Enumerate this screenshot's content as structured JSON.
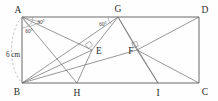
{
  "figure": {
    "shape": "rectangle",
    "vertices": [
      {
        "id": "A",
        "label": "A",
        "x": 22,
        "y": 17
      },
      {
        "id": "D",
        "label": "D",
        "x": 199,
        "y": 17
      },
      {
        "id": "B",
        "label": "B",
        "x": 22,
        "y": 83
      },
      {
        "id": "C",
        "label": "C",
        "x": 199,
        "y": 83
      },
      {
        "id": "G",
        "label": "G",
        "x": 118,
        "y": 17
      },
      {
        "id": "E",
        "label": "E",
        "x": 92,
        "y": 50
      },
      {
        "id": "F",
        "label": "F",
        "x": 137,
        "y": 50
      },
      {
        "id": "H",
        "label": "H",
        "x": 77,
        "y": 83
      },
      {
        "id": "I",
        "label": "I",
        "x": 158,
        "y": 83
      }
    ],
    "angles": [
      {
        "id": "angle-A-upper",
        "label": "30°",
        "at": "A",
        "x": 41,
        "y": 24
      },
      {
        "id": "angle-A-lower",
        "label": "60°",
        "at": "A",
        "x": 28,
        "y": 32
      },
      {
        "id": "angle-G-left",
        "label": "60°",
        "at": "G",
        "x": 102,
        "y": 25
      }
    ],
    "dimensions": [
      {
        "id": "side-AB",
        "label": "6 cm",
        "x": 4,
        "y": 55,
        "side": "AB"
      }
    ],
    "right_angle_marks": [
      {
        "id": "right-angle-E",
        "at": "E"
      },
      {
        "id": "right-angle-F",
        "at": "F"
      }
    ],
    "segments": [
      {
        "from": "A",
        "to": "D",
        "kind": "rectangle-side"
      },
      {
        "from": "D",
        "to": "C",
        "kind": "rectangle-side"
      },
      {
        "from": "C",
        "to": "B",
        "kind": "rectangle-side"
      },
      {
        "from": "B",
        "to": "A",
        "kind": "rectangle-side"
      },
      {
        "from": "A",
        "to": "E",
        "kind": "construction"
      },
      {
        "from": "A",
        "to": "H",
        "kind": "construction"
      },
      {
        "from": "B",
        "to": "E",
        "kind": "construction"
      },
      {
        "from": "B",
        "to": "G",
        "kind": "construction"
      },
      {
        "from": "G",
        "to": "E",
        "kind": "construction"
      },
      {
        "from": "G",
        "to": "F",
        "kind": "construction"
      },
      {
        "from": "G",
        "to": "I",
        "kind": "construction"
      },
      {
        "from": "E",
        "to": "H",
        "kind": "construction"
      },
      {
        "from": "F",
        "to": "D",
        "kind": "construction"
      },
      {
        "from": "F",
        "to": "C",
        "kind": "construction"
      },
      {
        "from": "F",
        "to": "I",
        "kind": "construction"
      },
      {
        "from": "B",
        "to": "F",
        "kind": "construction"
      }
    ]
  }
}
